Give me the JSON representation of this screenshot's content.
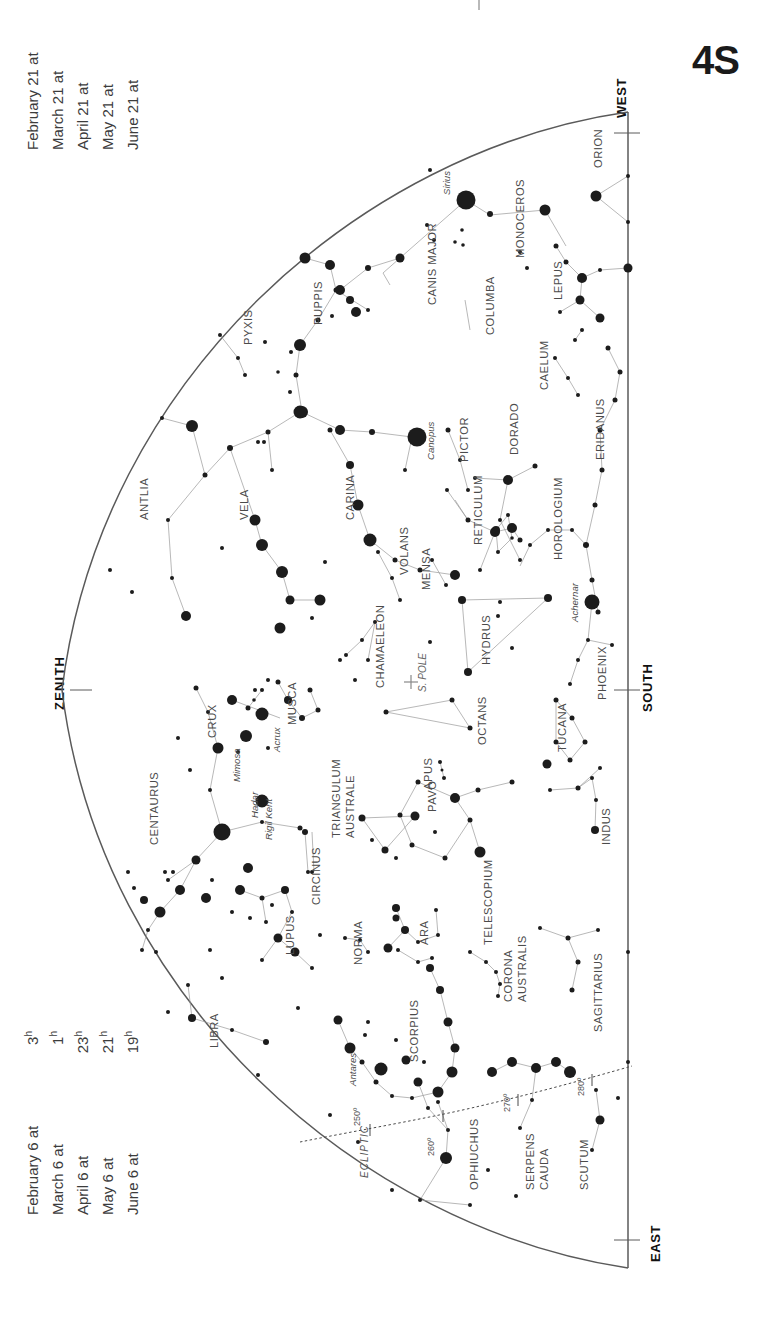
{
  "page": {
    "number": "4S",
    "chart_type": "southern-sky-star-chart"
  },
  "date_lists": {
    "top": {
      "entries": [
        {
          "date": "February 21 at",
          "time": "2",
          "unit": "h"
        },
        {
          "date": "March 21 at",
          "time": "midnight",
          "unit": ""
        },
        {
          "date": "April 21 at",
          "time": "22",
          "unit": "h"
        },
        {
          "date": "May 21 at",
          "time": "20",
          "unit": "h"
        },
        {
          "date": "June 21 at",
          "time": "18",
          "unit": "h"
        }
      ]
    },
    "bottom": {
      "entries": [
        {
          "date": "February 6 at",
          "time": "3",
          "unit": "h"
        },
        {
          "date": "March 6 at",
          "time": "1",
          "unit": "h"
        },
        {
          "date": "April 6 at",
          "time": "23",
          "unit": "h"
        },
        {
          "date": "May 6 at",
          "time": "21",
          "unit": "h"
        },
        {
          "date": "June 6 at",
          "time": "19",
          "unit": "h"
        }
      ]
    }
  },
  "compass": {
    "west": "WEST",
    "south": "SOUTH",
    "east": "EAST",
    "zenith": "ZENITH"
  },
  "ecliptic": {
    "label": "ECLIPTIC",
    "degree_marks": [
      "250º",
      "260º",
      "270º",
      "280º"
    ]
  },
  "pole": {
    "label": "S. POLE",
    "marker": "cross"
  },
  "chart_data": {
    "type": "scatter",
    "projection": "half-dome horizon view, rotated 90°",
    "constellations": [
      "ORION",
      "MONOCEROS",
      "CANIS MAJOR",
      "COLUMBA",
      "LEPUS",
      "CAELUM",
      "ERIDANUS",
      "PUPPIS",
      "PYXIS",
      "ANTLIA",
      "VELA",
      "CARINA",
      "PICTOR",
      "DORADO",
      "HOROLOGIUM",
      "RETICULUM",
      "MENSA",
      "VOLANS",
      "CHAMAELEON",
      "HYDRUS",
      "PHOENIX",
      "TUCANA",
      "OCTANS",
      "APUS",
      "MUSCA",
      "CRUX",
      "CENTAURUS",
      "TRIANGULUM AUSTRALE",
      "CIRCINUS",
      "PAVO",
      "INDUS",
      "NORMA",
      "ARA",
      "LUPUS",
      "LIBRA",
      "TELESCOPIUM",
      "CORONA AUSTRALIS",
      "SAGITTARIUS",
      "SCORPIUS",
      "OPHIUCHUS",
      "SERPENS CAUDA",
      "SCUTUM"
    ],
    "named_stars": [
      {
        "name": "Sirius",
        "magnitude": -1.46
      },
      {
        "name": "Canopus",
        "magnitude": -0.72
      },
      {
        "name": "Achernar",
        "magnitude": 0.46
      },
      {
        "name": "Rigil Kent",
        "magnitude": -0.27
      },
      {
        "name": "Hadar",
        "magnitude": 0.61
      },
      {
        "name": "Acrux",
        "magnitude": 0.77
      },
      {
        "name": "Mimosa",
        "magnitude": 1.25
      },
      {
        "name": "Antares",
        "magnitude": 0.96
      }
    ],
    "xlabel": "",
    "ylabel": ""
  }
}
